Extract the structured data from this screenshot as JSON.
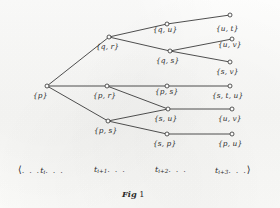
{
  "figure": {
    "caption_prefix": "Fig",
    "caption_number": "1",
    "background_color": "#fbfbfa",
    "ink_color": "#3b3b3b"
  },
  "chart_data": {
    "type": "diagram",
    "title": "Fig 1",
    "nodes": [
      {
        "id": "n0",
        "label": "{p}",
        "column": 0,
        "x": 47,
        "y": 86,
        "label_x": 33,
        "label_y": 92
      },
      {
        "id": "n1",
        "label": "{q, r}",
        "column": 1,
        "x": 109,
        "y": 37,
        "label_x": 96,
        "label_y": 43
      },
      {
        "id": "n2",
        "label": "{p, r}",
        "column": 1,
        "x": 107,
        "y": 86,
        "label_x": 93,
        "label_y": 92
      },
      {
        "id": "n3",
        "label": "{p, s}",
        "column": 1,
        "x": 108,
        "y": 121,
        "label_x": 94,
        "label_y": 127
      },
      {
        "id": "n4",
        "label": "{q, u}",
        "column": 2,
        "x": 167,
        "y": 24,
        "label_x": 153,
        "label_y": 26
      },
      {
        "id": "n5",
        "label": "{q, s}",
        "column": 2,
        "x": 170,
        "y": 51,
        "label_x": 156,
        "label_y": 57
      },
      {
        "id": "n6",
        "label": "{p, s}",
        "column": 2,
        "x": 167,
        "y": 86,
        "label_x": 155,
        "label_y": 88
      },
      {
        "id": "n7",
        "label": "{s, u}",
        "column": 2,
        "x": 168,
        "y": 109,
        "label_x": 154,
        "label_y": 115
      },
      {
        "id": "n8",
        "label": "{s, p}",
        "column": 2,
        "x": 167,
        "y": 134,
        "label_x": 153,
        "label_y": 140
      },
      {
        "id": "n9",
        "label": "{u, t}",
        "column": 3,
        "x": 230,
        "y": 15,
        "label_x": 216,
        "label_y": 25
      },
      {
        "id": "n10",
        "label": "{u, v}",
        "column": 3,
        "x": 232,
        "y": 39,
        "label_x": 218,
        "label_y": 41
      },
      {
        "id": "n11",
        "label": "{s, v}",
        "column": 3,
        "x": 230,
        "y": 62,
        "label_x": 216,
        "label_y": 68
      },
      {
        "id": "n12",
        "label": "{s, t, u}",
        "column": 3,
        "x": 230,
        "y": 86,
        "label_x": 212,
        "label_y": 92
      },
      {
        "id": "n13",
        "label": "{u, v}",
        "column": 3,
        "x": 232,
        "y": 109,
        "label_x": 218,
        "label_y": 115
      },
      {
        "id": "n14",
        "label": "{p, u}",
        "column": 3,
        "x": 232,
        "y": 134,
        "label_x": 218,
        "label_y": 140
      }
    ],
    "edges": [
      {
        "from": "n0",
        "to": "n1"
      },
      {
        "from": "n0",
        "to": "n2"
      },
      {
        "from": "n0",
        "to": "n3"
      },
      {
        "from": "n1",
        "to": "n4"
      },
      {
        "from": "n1",
        "to": "n5"
      },
      {
        "from": "n2",
        "to": "n6"
      },
      {
        "from": "n2",
        "to": "n7"
      },
      {
        "from": "n3",
        "to": "n7"
      },
      {
        "from": "n3",
        "to": "n8"
      },
      {
        "from": "n4",
        "to": "n9"
      },
      {
        "from": "n5",
        "to": "n10"
      },
      {
        "from": "n5",
        "to": "n11"
      },
      {
        "from": "n6",
        "to": "n12"
      },
      {
        "from": "n7",
        "to": "n13"
      },
      {
        "from": "n8",
        "to": "n14"
      }
    ],
    "axis": {
      "open_bracket": "⟨",
      "close_bracket": "⟩",
      "ellipsis": ". . .",
      "ticks": [
        {
          "base": "t",
          "sub": "i",
          "x": 18,
          "y": 165,
          "leading_ellipsis": true,
          "trailing_ellipsis": true,
          "open": true,
          "close": false
        },
        {
          "base": "t",
          "sub": "i+1",
          "x": 94,
          "y": 165,
          "leading_ellipsis": false,
          "trailing_ellipsis": true,
          "open": false,
          "close": false
        },
        {
          "base": "t",
          "sub": "i+2",
          "x": 155,
          "y": 165,
          "leading_ellipsis": false,
          "trailing_ellipsis": true,
          "open": false,
          "close": false
        },
        {
          "base": "t",
          "sub": "i+3",
          "x": 215,
          "y": 165,
          "leading_ellipsis": false,
          "trailing_ellipsis": true,
          "open": false,
          "close": true
        }
      ]
    },
    "caption": {
      "x": 122,
      "y": 190
    }
  }
}
